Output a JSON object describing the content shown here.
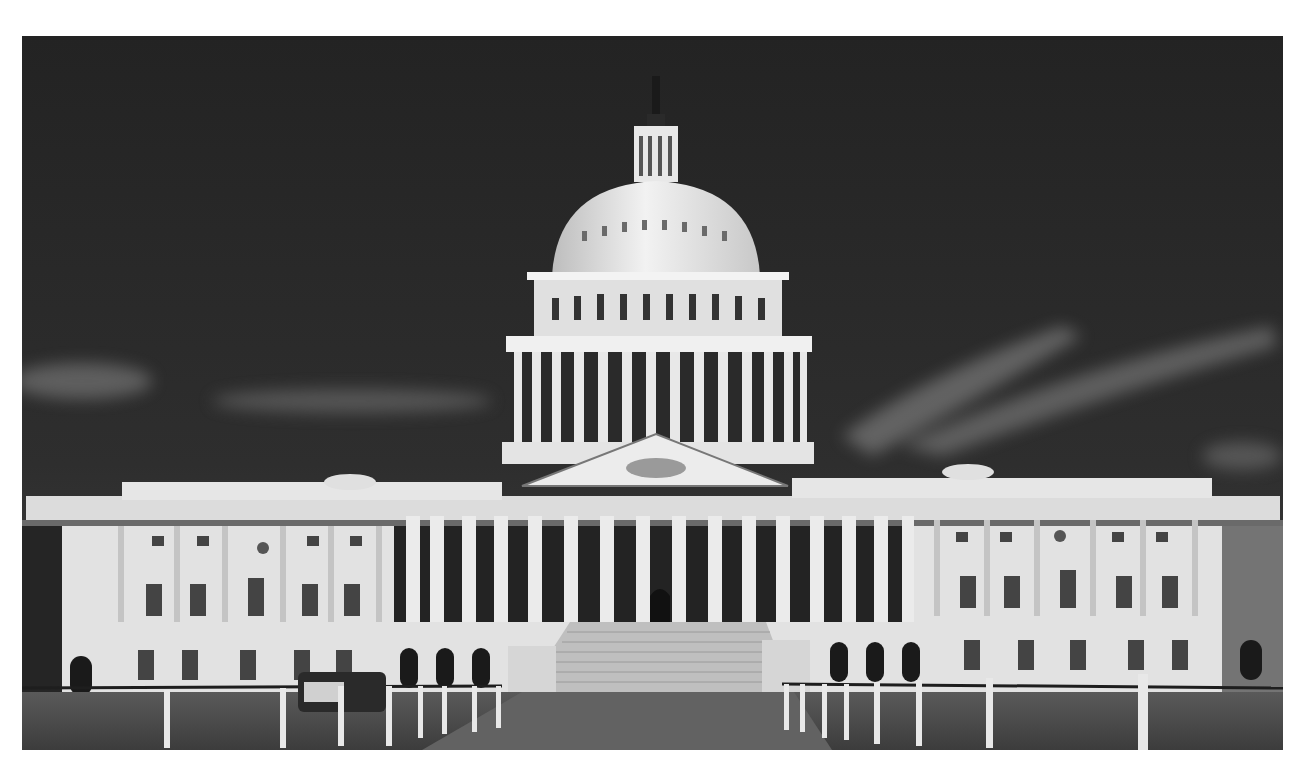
{
  "image": {
    "subject": "United States Capitol building",
    "style": "black-and-white photograph",
    "alt": "Black-and-white photograph of the U.S. Capitol dome and east front with stairs and bollards",
    "colors": {
      "page_background": "#ffffff",
      "sky_dark": "#262626",
      "sky_mid": "#3a3a3a",
      "cloud": "#8a8a8a",
      "stone": "#e6e6e6",
      "stone_shadow": "#9a9a9a",
      "column_shadow": "#1c1c1c",
      "plaza": "#4a4a4a"
    }
  }
}
